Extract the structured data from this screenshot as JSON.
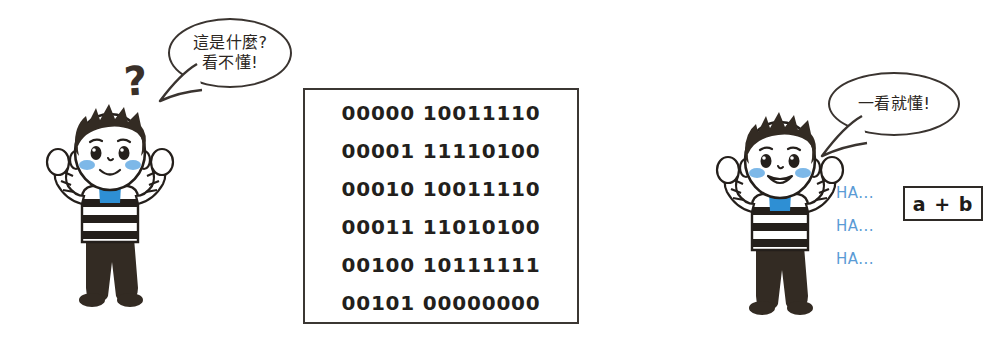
{
  "scene": {
    "title": "Binary machine code versus readable source code comic",
    "background_color": "#ffffff"
  },
  "colors": {
    "ink": "#2b2622",
    "hair": "#332b23",
    "blush": "#7db8e8",
    "collar_blue": "#2e8fd4",
    "ha_blue": "#5a9bd5",
    "box_border": "#3b3733",
    "skin": "#ffffff",
    "stripe_dark": "#241f1b"
  },
  "left_side": {
    "character": {
      "name": "confused-boy",
      "pose": "both-arms-raised",
      "expression": "puzzled"
    },
    "question_mark": "?",
    "bubble": {
      "lines": [
        "這是什麼?",
        "看不懂!"
      ]
    }
  },
  "code_box": {
    "lines": [
      "00000 10011110",
      "00001 11110100",
      "00010 10011110",
      "00011 11010100",
      "00100 10111111",
      "00101 00000000"
    ]
  },
  "right_side": {
    "character": {
      "name": "happy-boy",
      "pose": "both-arms-raised",
      "expression": "smiling"
    },
    "bubble": {
      "lines": [
        "一看就懂!"
      ]
    },
    "ha_lines": [
      "HA...",
      "HA...",
      "HA..."
    ],
    "formula": "a + b"
  }
}
